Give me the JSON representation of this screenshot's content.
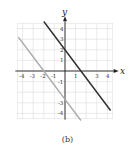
{
  "chart_data": {
    "type": "line",
    "title": "",
    "caption": "(b)",
    "xlabel": "x",
    "ylabel": "y",
    "xlim": [
      -4.5,
      4.5
    ],
    "ylim": [
      -4.5,
      4.5
    ],
    "grid": true,
    "x_ticks": [
      "-4",
      "-3",
      "-2",
      "-1",
      "1",
      "3",
      "4"
    ],
    "y_ticks": [
      "4",
      "3",
      "2",
      "1",
      "-1",
      "-3",
      "-4"
    ],
    "series": [
      {
        "name": "dark line",
        "color": "#333333",
        "equation": "y = -4/3 x + 2",
        "points": [
          [
            -2,
            4.67
          ],
          [
            0,
            2
          ],
          [
            1.5,
            0
          ],
          [
            4.3,
            -3.73
          ]
        ]
      },
      {
        "name": "gray line",
        "color": "#aaaaaa",
        "equation": "y = -4/3 x - 8/3",
        "points": [
          [
            -4.4,
            3.2
          ],
          [
            -2,
            0
          ],
          [
            0,
            -2.67
          ],
          [
            1.5,
            -4.67
          ]
        ]
      }
    ]
  }
}
